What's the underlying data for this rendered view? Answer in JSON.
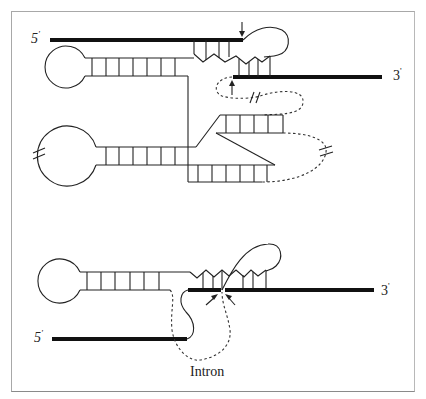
{
  "figure": {
    "labels": {
      "top_five_prime": "5",
      "top_five_prime_mark": "'",
      "top_three_prime": "3",
      "top_three_prime_mark": "'",
      "bottom_five_prime": "5",
      "bottom_five_prime_mark": "'",
      "bottom_three_prime": "3",
      "bottom_three_prime_mark": "'",
      "intron": "Intron"
    },
    "colors": {
      "line": "#222222",
      "exon": "#111111",
      "frame": "#a8a8a8",
      "background": "#ffffff"
    }
  }
}
